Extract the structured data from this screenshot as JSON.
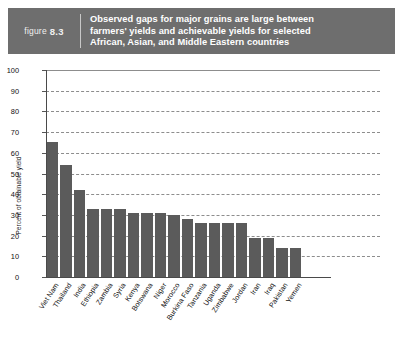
{
  "header": {
    "figure_word": "figure",
    "figure_number": "8.3",
    "title_line1": "Observed gaps for major grains are large between",
    "title_line2": "farmers' yields and achievable yields for selected",
    "title_line3": "African, Asian, and Middle Eastern countries",
    "band_color": "#6e6e6e",
    "title_color": "#ffffff"
  },
  "chart_data": {
    "type": "bar",
    "title": "Observed gaps for major grains are large between farmers' yields and achievable yields for selected African, Asian, and Middle Eastern countries",
    "xlabel": "",
    "ylabel": "Percent of obtainable yield",
    "ylim": [
      0,
      100
    ],
    "ytick_step": 10,
    "yticks": [
      "100",
      "90",
      "80",
      "70",
      "60",
      "50",
      "40",
      "30",
      "20",
      "10",
      "0"
    ],
    "grid": true,
    "legend": "none",
    "bar_color": "#5b5b5b",
    "categories": [
      "Viet Nam",
      "Thailand",
      "India",
      "Ethiopia",
      "Zambia",
      "Syria",
      "Kenya",
      "Botswana",
      "Niger",
      "Morocco",
      "Burkina Faso",
      "Tanzania",
      "Uganda",
      "Zimbabwe",
      "Jordan",
      "Iran",
      "Iraq",
      "Pakistan",
      "Yemen"
    ],
    "values": [
      65,
      54,
      42,
      33,
      33,
      33,
      31,
      31,
      31,
      30,
      28,
      26,
      26,
      26,
      26,
      19,
      19,
      14,
      14
    ]
  }
}
